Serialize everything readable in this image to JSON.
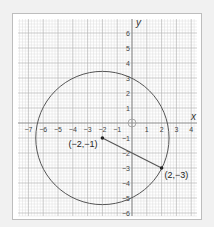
{
  "chart_data": {
    "type": "scatter",
    "title": "",
    "xlabel": "x",
    "ylabel": "y",
    "xlim": [
      -7.6,
      4.4
    ],
    "ylim": [
      -6.2,
      6.9
    ],
    "grid": true,
    "x_ticks": [
      -7,
      -6,
      -5,
      -4,
      -3,
      -2,
      -1,
      1,
      2,
      3,
      4
    ],
    "y_ticks": [
      -6,
      -5,
      -4,
      -3,
      -2,
      -1,
      1,
      2,
      3,
      4,
      5,
      6
    ],
    "shapes": [
      {
        "type": "circle",
        "center": [
          -2,
          -1
        ],
        "radius": 4.472
      },
      {
        "type": "segment",
        "from": [
          -2,
          -1
        ],
        "to": [
          2,
          -3
        ]
      },
      {
        "type": "hollow-circle",
        "center": [
          0,
          0
        ],
        "radius": 0.27
      }
    ],
    "points": [
      {
        "x": -2,
        "y": -1,
        "label": "(−2,−1)"
      },
      {
        "x": 2,
        "y": -3,
        "label": "(2,−3)"
      }
    ]
  },
  "labels": {
    "x_axis": "x",
    "y_axis": "y",
    "center_point": "(−2,−1)",
    "edge_point": "(2,−3)"
  },
  "colors": {
    "background": "#f1f1f1",
    "panel": "#ffffff",
    "minor_grid": "#dcdcdc",
    "major_grid": "#b4b4b4",
    "axis": "#8a8a8a",
    "curve": "#555555"
  }
}
